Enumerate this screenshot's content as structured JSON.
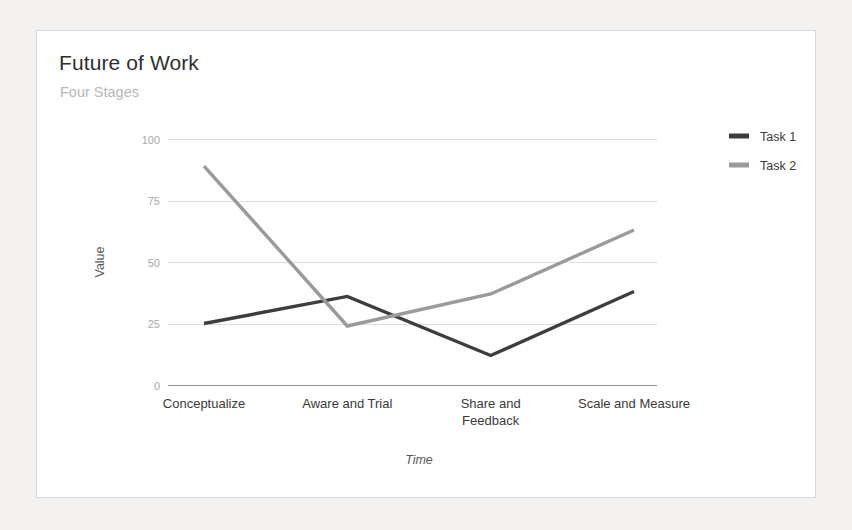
{
  "page": {
    "background_color": "#f2f1ef",
    "card_background": "#ffffff",
    "card_border_color": "#d8d8d8"
  },
  "chart_data": {
    "type": "line",
    "title": "Future of Work",
    "subtitle": "Four Stages",
    "xlabel": "Time",
    "ylabel": "Value",
    "categories": [
      "Conceptualize",
      "Aware and Trial",
      "Share and Feedback",
      "Scale and Measure"
    ],
    "category_label_lines": [
      [
        "Conceptualize"
      ],
      [
        "Aware and Trial"
      ],
      [
        "Share and",
        "Feedback"
      ],
      [
        "Scale and Measure"
      ]
    ],
    "series": [
      {
        "name": "Task 1",
        "color": "#3d3d3d",
        "values": [
          25,
          36,
          12,
          38
        ]
      },
      {
        "name": "Task 2",
        "color": "#9a9a9a",
        "values": [
          89,
          24,
          37,
          63
        ]
      }
    ],
    "ylim": [
      0,
      100
    ],
    "yticks": [
      0,
      25,
      50,
      75,
      100
    ],
    "ytick_labels": [
      "0",
      "25",
      "50",
      "75",
      "100"
    ],
    "grid": true,
    "legend_position": "right",
    "legend": [
      {
        "label": "Task 1",
        "color": "#3d3d3d"
      },
      {
        "label": "Task 2",
        "color": "#9a9a9a"
      }
    ]
  }
}
